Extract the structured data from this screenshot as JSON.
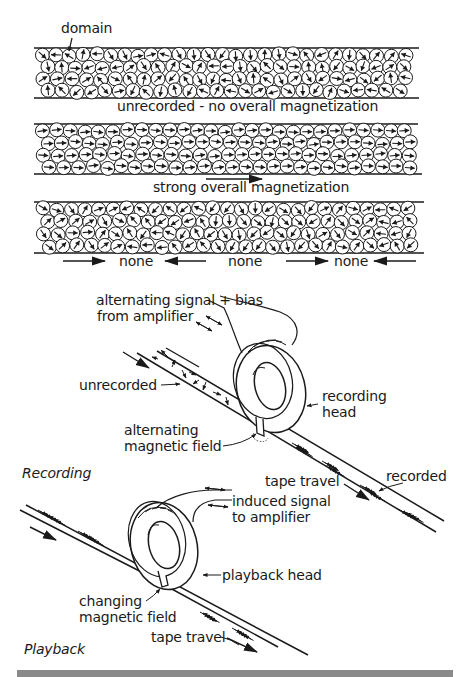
{
  "figure": {
    "panels": {
      "tape_unrecorded": {
        "pointer_label": "domain",
        "caption": "unrecorded - no overall magnetization",
        "orientation": "random"
      },
      "tape_magnetized": {
        "caption": "strong overall magnetization",
        "orientation": "right"
      },
      "tape_cancelled": {
        "captions": [
          "none",
          "none",
          "none"
        ],
        "orientation": "alternating"
      }
    },
    "recording": {
      "section_label": "Recording",
      "signal_label_line1": "alternating signal + bias",
      "signal_label_line2": "from amplifier",
      "unrecorded_label": "unrecorded",
      "head_label_line1": "recording",
      "head_label_line2": "head",
      "field_label_line1": "alternating",
      "field_label_line2": "magnetic field",
      "travel_label": "tape travel",
      "recorded_label": "recorded"
    },
    "playback": {
      "section_label": "Playback",
      "signal_label_line1": "induced signal",
      "signal_label_line2": "to amplifier",
      "head_label": "playback head",
      "field_label_line1": "changing",
      "field_label_line2": "magnetic field",
      "travel_label": "tape travel"
    },
    "colors": {
      "ink": "#1a1a1a",
      "footer_bar": "#8a8a8a",
      "background": "#ffffff"
    }
  }
}
